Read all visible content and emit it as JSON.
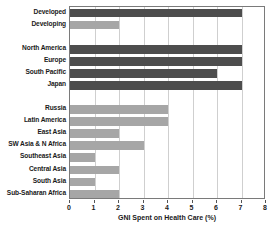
{
  "chart_data": {
    "type": "bar",
    "orientation": "horizontal",
    "title": "",
    "xlabel": "GNI Spent on Health Care (%)",
    "ylabel": "",
    "xlim": [
      0,
      8
    ],
    "xticks": [
      0,
      1,
      2,
      3,
      4,
      5,
      6,
      7,
      8
    ],
    "xtick_labels": [
      "0",
      "1",
      "2",
      "3",
      "4",
      "5",
      "6",
      "7",
      "8"
    ],
    "grid": true,
    "grid_axis": "x",
    "legend": false,
    "legend_position": "none",
    "colors": {
      "dark_bar": "#4d4d4d",
      "light_bar": "#a6a6a6",
      "gridline": "#cfcfcf",
      "frame": "#7a7a7a",
      "text": "#1a1a1a",
      "background": "#ffffff"
    },
    "categories": [
      "Developed",
      "Developing",
      "North America",
      "Europe",
      "South Pacific",
      "Japan",
      "Russia",
      "Latin America",
      "East Asia",
      "SW Asia & N Africa",
      "Southeast Asia",
      "Central Asia",
      "South Asia",
      "Sub-Saharan Africa"
    ],
    "values": [
      7,
      2,
      7,
      7,
      6,
      7,
      4,
      4,
      2,
      3,
      1,
      2,
      1,
      2
    ],
    "bars": [
      {
        "label": "Developed",
        "value": 7,
        "shade": "dark",
        "group": 0
      },
      {
        "label": "Developing",
        "value": 2,
        "shade": "light",
        "group": 0
      },
      {
        "label": "North America",
        "value": 7,
        "shade": "dark",
        "group": 1
      },
      {
        "label": "Europe",
        "value": 7,
        "shade": "dark",
        "group": 1
      },
      {
        "label": "South Pacific",
        "value": 6,
        "shade": "dark",
        "group": 1
      },
      {
        "label": "Japan",
        "value": 7,
        "shade": "dark",
        "group": 1
      },
      {
        "label": "Russia",
        "value": 4,
        "shade": "light",
        "group": 2
      },
      {
        "label": "Latin America",
        "value": 4,
        "shade": "light",
        "group": 2
      },
      {
        "label": "East Asia",
        "value": 2,
        "shade": "light",
        "group": 2
      },
      {
        "label": "SW Asia & N Africa",
        "value": 3,
        "shade": "light",
        "group": 2
      },
      {
        "label": "Southeast Asia",
        "value": 1,
        "shade": "light",
        "group": 2
      },
      {
        "label": "Central Asia",
        "value": 2,
        "shade": "light",
        "group": 2
      },
      {
        "label": "South Asia",
        "value": 1,
        "shade": "light",
        "group": 2
      },
      {
        "label": "Sub-Saharan Africa",
        "value": 2,
        "shade": "light",
        "group": 2
      }
    ]
  }
}
